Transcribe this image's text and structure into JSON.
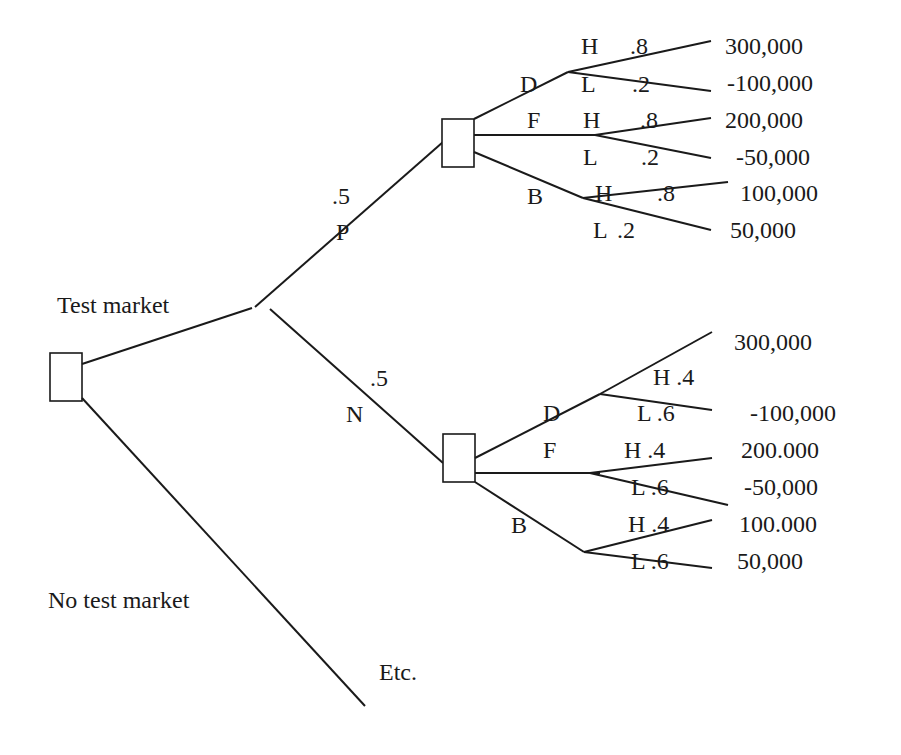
{
  "diagram": {
    "type": "decision-tree",
    "root": {
      "branches": {
        "test_market": "Test market",
        "no_test_market": "No test market",
        "etc": "Etc."
      }
    },
    "test_outcomes": {
      "positive": {
        "label": "P",
        "prob": ".5"
      },
      "negative": {
        "label": "N",
        "prob": ".5"
      }
    },
    "positive_node": {
      "decisions": [
        "D",
        "F",
        "B"
      ],
      "outcomes": [
        {
          "h": "H",
          "hp": ".8",
          "l": "L",
          "lp": ".2",
          "hv": "300,000",
          "lv": "-100,000"
        },
        {
          "h": "H",
          "hp": ".8",
          "l": "L",
          "lp": ".2",
          "hv": "200,000",
          "lv": "-50,000"
        },
        {
          "h": "H",
          "hp": ".8",
          "l": "L",
          "lp": ".2",
          "hv": "100,000",
          "lv": "50,000"
        }
      ]
    },
    "negative_node": {
      "decisions": [
        "D",
        "F",
        "B"
      ],
      "outcomes": [
        {
          "h": "H .4",
          "l": "L .6",
          "hv": "300,000",
          "lv": "-100,000"
        },
        {
          "h": "H .4",
          "l": "L .6",
          "hv": "200.000",
          "lv": "-50,000"
        },
        {
          "h": "H .4",
          "l": "L .6",
          "hv": "100.000",
          "lv": "50,000"
        }
      ]
    },
    "colors": {
      "line": "#1a1a1a",
      "background": "#ffffff"
    }
  }
}
